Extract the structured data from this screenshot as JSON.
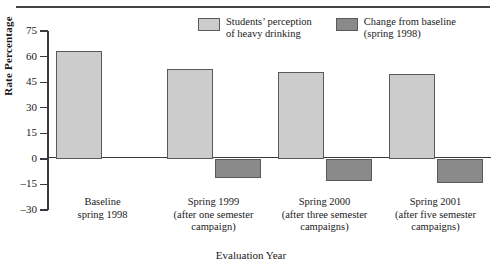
{
  "figure": {
    "colors": {
      "series1": "#cccccc",
      "series2": "#8a8a8a",
      "bar_border": "#5a5a5a",
      "axis": "#3a3a3a",
      "rule": "#444444",
      "text": "#1a1a1a"
    }
  },
  "chart_data": {
    "type": "bar",
    "title": "",
    "xlabel": "Evaluation Year",
    "ylabel": "Rate Percentage",
    "ylim": [
      -30,
      75
    ],
    "yticks": [
      75,
      60,
      45,
      30,
      15,
      0,
      -15,
      -30
    ],
    "ytick_labels": [
      "75",
      "60",
      "45",
      "30",
      "15",
      "0",
      "–15",
      "–30"
    ],
    "grid": false,
    "legend_position": "top-right",
    "categories": [
      "Baseline spring 1998",
      "Spring 1999 (after one semester campaign)",
      "Spring 2000 (after three semester campaigns)",
      "Spring 2001 (after five semester campaigns)"
    ],
    "category_lines": [
      [
        "Baseline",
        "spring 1998"
      ],
      [
        "Spring 1999",
        "(after one semester",
        "campaign)"
      ],
      [
        "Spring 2000",
        "(after three semester",
        "campaigns)"
      ],
      [
        "Spring 2001",
        "(after five semester",
        "campaigns)"
      ]
    ],
    "series": [
      {
        "name": "Students’ perception of heavy drinking",
        "legend_lines": [
          "Students’ perception",
          "of heavy drinking"
        ],
        "color": "#cccccc",
        "values": [
          63,
          53,
          51,
          50
        ]
      },
      {
        "name": "Change from baseline (spring 1998)",
        "legend_lines": [
          "Change from baseline",
          "(spring 1998)"
        ],
        "color": "#8a8a8a",
        "values": [
          null,
          -11,
          -13,
          -14
        ]
      }
    ]
  }
}
